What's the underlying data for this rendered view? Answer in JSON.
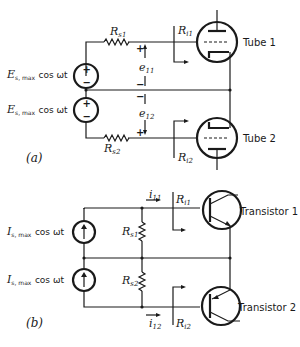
{
  "panel_a": {
    "label": "(a)",
    "source1": {
      "symbol": "E",
      "sub": "s, max",
      "expr": "cos ωt"
    },
    "source2": {
      "symbol": "E",
      "sub": "s, max",
      "expr": "cos ωt"
    },
    "rs1": {
      "symbol": "R",
      "sub": "s1"
    },
    "rs2": {
      "symbol": "R",
      "sub": "s2"
    },
    "ri1": {
      "symbol": "R",
      "sub": "i1"
    },
    "ri2": {
      "symbol": "R",
      "sub": "i2"
    },
    "e11": {
      "symbol": "e",
      "sub": "11"
    },
    "e12": {
      "symbol": "e",
      "sub": "12"
    },
    "plus": "+",
    "minus": "−",
    "tube1": "Tube 1",
    "tube2": "Tube 2"
  },
  "panel_b": {
    "label": "(b)",
    "source1": {
      "symbol": "I",
      "sub": "s, max",
      "expr": "cos ωt"
    },
    "source2": {
      "symbol": "I",
      "sub": "s, max",
      "expr": "cos ωt"
    },
    "rs1": {
      "symbol": "R",
      "sub": "s1"
    },
    "rs2": {
      "symbol": "R",
      "sub": "s2"
    },
    "ri1": {
      "symbol": "R",
      "sub": "i1"
    },
    "ri2": {
      "symbol": "R",
      "sub": "i2"
    },
    "i11": {
      "symbol": "i",
      "sub": "11"
    },
    "i12": {
      "symbol": "i",
      "sub": "12"
    },
    "transistor1": "Transistor 1",
    "transistor2": "Transistor 2"
  }
}
